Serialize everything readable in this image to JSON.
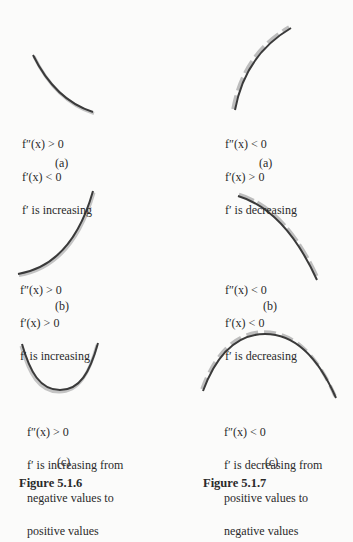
{
  "figures": [
    {
      "caption": "Figure 5.1.6",
      "panels": [
        {
          "label": "(a)",
          "lines": [
            "f″(x) > 0",
            "f′(x) < 0",
            "f′ is increasing"
          ],
          "shape": "decreasing, concave up"
        },
        {
          "label": "(b)",
          "lines": [
            "f″(x) > 0",
            "f′(x) > 0",
            "f′ is increasing"
          ],
          "shape": "increasing, concave up"
        },
        {
          "label": "(c)",
          "lines": [
            "f″(x) > 0",
            "f′ is increasing from",
            "negative values to",
            "positive values"
          ],
          "shape": "U-shaped, concave up"
        }
      ]
    },
    {
      "caption": "Figure 5.1.7",
      "panels": [
        {
          "label": "(a)",
          "lines": [
            "f″(x) < 0",
            "f′(x) > 0",
            "f′ is decreasing"
          ],
          "shape": "increasing, concave down"
        },
        {
          "label": "(b)",
          "lines": [
            "f″(x) < 0",
            "f′(x) < 0",
            "f′ is decreasing"
          ],
          "shape": "decreasing, concave down"
        },
        {
          "label": "(c)",
          "lines": [
            "f″(x) < 0",
            "f′ is decreasing from",
            "positive values to",
            "negative values"
          ],
          "shape": "arch-shaped, concave down"
        }
      ]
    }
  ],
  "colors": {
    "curve": "#3a3a3a",
    "tangent_shadow": "#b8b8b8",
    "text": "#2a2a2a",
    "background": "#fbfbfa"
  }
}
